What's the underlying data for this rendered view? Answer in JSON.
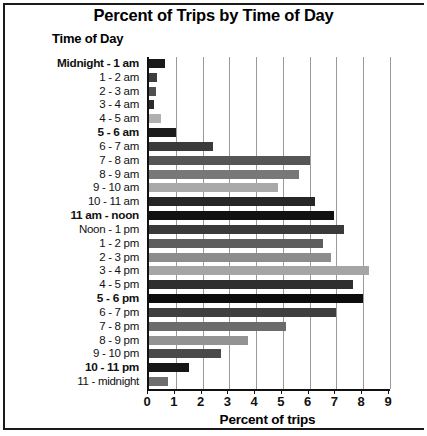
{
  "chart_data": {
    "type": "bar",
    "orientation": "horizontal",
    "title": "Percent of Trips by Time of Day",
    "ylabel": "Time of Day",
    "xlabel": "Percent of trips",
    "xlim": [
      0,
      9
    ],
    "xticks": [
      0,
      1,
      2,
      3,
      4,
      5,
      6,
      7,
      8,
      9
    ],
    "xtick_labels": [
      "0",
      "1",
      "2",
      "3",
      "4",
      "5",
      "6",
      "7",
      "8",
      "9"
    ],
    "grid": true,
    "grid_axis": "x",
    "legend": null,
    "categories": [
      "Midnight - 1 am",
      "1 - 2 am",
      "2 - 3 am",
      "3 - 4 am",
      "4 - 5 am",
      "5 - 6 am",
      "6 - 7 am",
      "7 - 8 am",
      "8 - 9 am",
      "9 - 10 am",
      "10 - 11 am",
      "11 am - noon",
      "Noon - 1 pm",
      "1 - 2 pm",
      "2 - 3 pm",
      "3 - 4 pm",
      "4 - 5 pm",
      "5 - 6 pm",
      "6 - 7 pm",
      "7 - 8 pm",
      "8 - 9 pm",
      "9 - 10 pm",
      "10 - 11 pm",
      "11 - midnight"
    ],
    "category_emphasis": [
      true,
      false,
      false,
      false,
      false,
      true,
      false,
      false,
      false,
      false,
      false,
      true,
      false,
      false,
      false,
      false,
      false,
      true,
      false,
      false,
      false,
      false,
      true,
      false
    ],
    "values": [
      0.6,
      0.3,
      0.25,
      0.2,
      0.45,
      1.0,
      2.4,
      6.0,
      5.6,
      4.8,
      6.2,
      6.9,
      7.3,
      6.5,
      6.8,
      8.2,
      7.6,
      8.0,
      7.0,
      5.1,
      3.7,
      2.7,
      1.5,
      0.7
    ],
    "bar_colors": [
      "#1a1a1a",
      "#3d3d3d",
      "#4f4f4f",
      "#2b2b2b",
      "#b0b0b0",
      "#1c1c1c",
      "#3b3b3b",
      "#565656",
      "#787878",
      "#a9a9a9",
      "#262626",
      "#111111",
      "#3a3a3a",
      "#5e5e5e",
      "#8c8c8c",
      "#a5a5a5",
      "#2e2e2e",
      "#0d0d0d",
      "#3f3f3f",
      "#6b6b6b",
      "#939393",
      "#4a4a4a",
      "#171717",
      "#6e6e6e"
    ]
  },
  "axis": {
    "x_axis_color": "#111111",
    "gridline_color": "#9a9a9a",
    "frame_color": "#1a1a1a"
  }
}
